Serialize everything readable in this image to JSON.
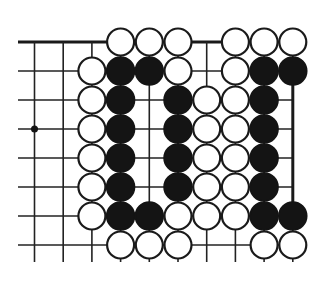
{
  "diagram": {
    "board": {
      "columns": 10,
      "rows": 8,
      "top_edge": true,
      "right_edge": true,
      "right_edge_rows": [
        1,
        6
      ],
      "star_points": [
        [
          0,
          3
        ]
      ]
    },
    "stones": {
      "legend": {
        "B": "black",
        "W": "white",
        ".": "empty"
      },
      "grid": [
        "...WWW.WWW",
        "..WBBW.WBB",
        "..WB.BWWB.",
        "..WB.BWWB.",
        "..WB.BWWB.",
        "..WB.BWWB.",
        "..WBBWWWBB",
        "...WWW..WW"
      ]
    },
    "colors": {
      "black_stone": "#141414",
      "white_stone": "#ffffff",
      "line": "#222222"
    }
  }
}
